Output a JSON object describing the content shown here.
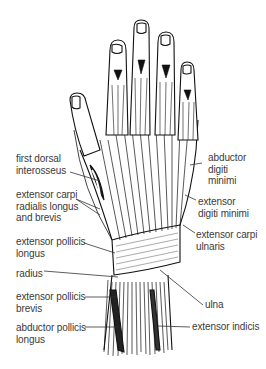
{
  "figure": {
    "colors": {
      "ink": "#111111",
      "label_text": "#3a3a3a",
      "leader_line": "#333333",
      "background": "#ffffff"
    }
  },
  "labels": {
    "left": [
      {
        "id": "first-dorsal-interosseus",
        "text": "first dorsal\ninterosseus"
      },
      {
        "id": "extensor-carpi-radialis",
        "text": "extensor carpi\nradialis longus\nand brevis"
      },
      {
        "id": "extensor-pollicis-longus",
        "text": "extensor pollicis\nlongus"
      },
      {
        "id": "radius",
        "text": "radius"
      },
      {
        "id": "extensor-pollicis-brevis",
        "text": "extensor pollicis\nbrevis"
      },
      {
        "id": "abductor-pollicis-longus",
        "text": "abductor pollicis\nlongus"
      }
    ],
    "right": [
      {
        "id": "abductor-digiti-minimi",
        "text": "abductor\ndigiti\nminimi"
      },
      {
        "id": "extensor-digiti-minimi",
        "text": "extensor\ndigiti minimi"
      },
      {
        "id": "extensor-carpi-ulnaris",
        "text": "extensor carpi\nulnaris"
      },
      {
        "id": "ulna",
        "text": "ulna"
      },
      {
        "id": "extensor-indicis",
        "text": "extensor indicis"
      }
    ]
  }
}
